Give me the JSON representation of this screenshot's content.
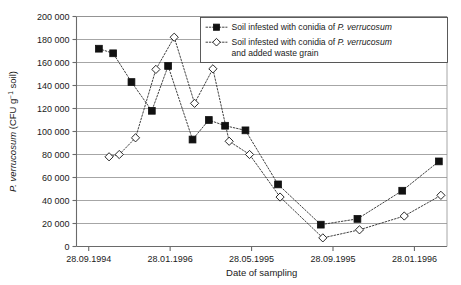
{
  "chart_data": {
    "type": "line",
    "title": "",
    "xlabel": "Date of sampling",
    "ylabel_plain": "P. verrucosum (CFU g-1 soil)",
    "ylabel_parts": {
      "italic": "P. verrucosum",
      "rest_open": " (CFU g",
      "superscript": "−1",
      "rest_close": " soil)"
    },
    "ylim": [
      0,
      200000
    ],
    "y_ticks": [
      0,
      20000,
      40000,
      60000,
      80000,
      100000,
      120000,
      140000,
      160000,
      180000,
      200000
    ],
    "y_tick_labels": [
      "0",
      "20 000",
      "40 000",
      "60 000",
      "80 000",
      "100 000",
      "120 000",
      "140 000",
      "160 000",
      "180 000",
      "200 000"
    ],
    "x_tick_labels": [
      "28.09.1994",
      "28.01.1996",
      "28.05.1995",
      "28.09.1995",
      "28.01.1996"
    ],
    "x_tick_positions": [
      0,
      4,
      8,
      12,
      16
    ],
    "x_range": [
      -0.6,
      17.6
    ],
    "grid": "horizontal",
    "legend_position": "top-right",
    "series": [
      {
        "name": "Soil infested with conidia of P. verrucosum",
        "name_parts": {
          "plain": "Soil infested with conidia of ",
          "italic": "P. verrucosum",
          "tail": ""
        },
        "marker": "filled-square",
        "marker_color": "#111111",
        "line_style": "dotted",
        "x": [
          0.5,
          1.2,
          2.1,
          3.1,
          3.9,
          5.1,
          5.9,
          6.7,
          7.4,
          8.3,
          9.6,
          11.3,
          13.0,
          15.3,
          17.2
        ],
        "values": [
          172000,
          168000,
          143000,
          118000,
          157000,
          93000,
          110000,
          105000,
          101000,
          54000,
          19000,
          24000,
          48500,
          74000,
          null
        ],
        "points": [
          {
            "x": 0.5,
            "y": 172000
          },
          {
            "x": 1.2,
            "y": 168000
          },
          {
            "x": 2.1,
            "y": 143000
          },
          {
            "x": 3.1,
            "y": 118000
          },
          {
            "x": 3.9,
            "y": 157000
          },
          {
            "x": 5.1,
            "y": 93000
          },
          {
            "x": 5.9,
            "y": 110000
          },
          {
            "x": 6.7,
            "y": 105000
          },
          {
            "x": 7.7,
            "y": 101000
          },
          {
            "x": 9.3,
            "y": 54000
          },
          {
            "x": 11.4,
            "y": 19000
          },
          {
            "x": 13.2,
            "y": 24000
          },
          {
            "x": 15.4,
            "y": 48500
          },
          {
            "x": 17.2,
            "y": 74000
          }
        ]
      },
      {
        "name": "Soil infested with conidia of P. verrucosum and added waste grain",
        "name_parts": {
          "plain": "Soil infested with conidia of ",
          "italic": "P. verrucosum",
          "tail": "and added waste grain"
        },
        "marker": "open-diamond",
        "marker_color": "#ffffff",
        "line_style": "dotted",
        "points": [
          {
            "x": 1.0,
            "y": 78000
          },
          {
            "x": 1.5,
            "y": 80000
          },
          {
            "x": 2.3,
            "y": 94500
          },
          {
            "x": 3.3,
            "y": 154000
          },
          {
            "x": 4.2,
            "y": 182000
          },
          {
            "x": 5.2,
            "y": 124500
          },
          {
            "x": 6.1,
            "y": 154500
          },
          {
            "x": 6.9,
            "y": 91500
          },
          {
            "x": 7.9,
            "y": 80000
          },
          {
            "x": 9.4,
            "y": 43000
          },
          {
            "x": 11.5,
            "y": 7500
          },
          {
            "x": 13.3,
            "y": 14500
          },
          {
            "x": 15.5,
            "y": 26500
          },
          {
            "x": 17.3,
            "y": 44500
          }
        ]
      }
    ]
  },
  "legend": {
    "entries": [
      {
        "plain": "Soil infested with conidia of ",
        "italic": "P. verrucosum",
        "line2": ""
      },
      {
        "plain": "Soil infested with conidia of ",
        "italic": "P. verrucosum",
        "line2": "and added waste grain"
      }
    ]
  }
}
